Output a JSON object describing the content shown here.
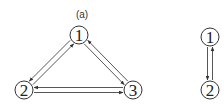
{
  "panels": [
    {
      "label": "(a)",
      "nodes": [
        {
          "id": "1",
          "label": "1",
          "cx": 79,
          "cy": 35
        },
        {
          "id": "2",
          "label": "2",
          "cx": 24,
          "cy": 90
        },
        {
          "id": "3",
          "label": "3",
          "cx": 133,
          "cy": 90
        }
      ],
      "edges": [
        {
          "from": "1",
          "to": "2"
        },
        {
          "from": "2",
          "to": "1"
        },
        {
          "from": "1",
          "to": "3"
        },
        {
          "from": "3",
          "to": "1"
        },
        {
          "from": "2",
          "to": "3"
        },
        {
          "from": "3",
          "to": "2"
        }
      ]
    },
    {
      "label": "",
      "nodes": [
        {
          "id": "1",
          "label": "1",
          "cx": 210,
          "cy": 37
        },
        {
          "id": "2",
          "label": "2",
          "cx": 210,
          "cy": 90
        }
      ],
      "edges": [
        {
          "from": "1",
          "to": "2"
        },
        {
          "from": "2",
          "to": "1"
        }
      ]
    }
  ],
  "style": {
    "node_radius": 9,
    "stroke_color": "#333333"
  }
}
